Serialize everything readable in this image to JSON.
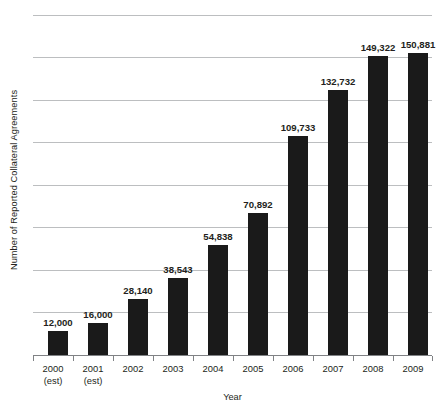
{
  "chart_data": {
    "type": "bar",
    "title": "",
    "subtitle": "",
    "xlabel": "Year",
    "ylabel": "Number of Reported Collateral Agreements",
    "categories": [
      "2000",
      "2001",
      "2002",
      "2003",
      "2004",
      "2005",
      "2006",
      "2007",
      "2008",
      "2009"
    ],
    "category_sublabels": [
      "(est)",
      "(est)",
      "",
      "",
      "",
      "",
      "",
      "",
      "",
      ""
    ],
    "values": [
      12000,
      16000,
      28140,
      38543,
      54838,
      70892,
      109733,
      132732,
      149322,
      150881
    ],
    "value_labels": [
      "12,000",
      "16,000",
      "28,140",
      "38,543",
      "54,838",
      "70,892",
      "109,733",
      "132,732",
      "149,322",
      "150,881"
    ],
    "ylim": [
      0,
      170000
    ],
    "xlim_categories": 10,
    "grid": true,
    "gridlines_count": 9,
    "y_tick_labels": [],
    "legend": false,
    "legend_position": "none",
    "bar_color": "#1a1a1a",
    "gridline_color": "#bcbec0",
    "axis_color": "#808285",
    "background_color": "#ffffff",
    "text_color": "#231f20",
    "annotations": [
      "Data labels shown above each bar",
      "2000 and 2001 values are estimates"
    ]
  }
}
